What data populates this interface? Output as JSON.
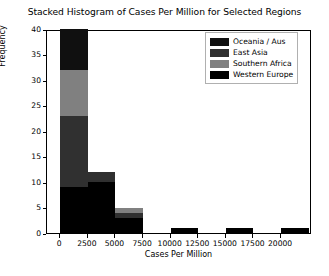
{
  "chart_data": {
    "type": "bar",
    "subtype": "stacked-histogram",
    "title": "Stacked Histogram of Cases Per Million for Selected Regions",
    "xlabel": "Cases Per Million",
    "ylabel": "Frequency",
    "xlim": [
      -1200,
      22800
    ],
    "ylim": [
      0,
      40
    ],
    "grid": false,
    "legend_position": "upper right",
    "bin_width": 2500,
    "bin_edges": [
      0,
      2500,
      5000,
      7500,
      10000,
      12500,
      15000,
      17500,
      20000,
      22500
    ],
    "xticks": [
      0,
      2500,
      5000,
      7500,
      10000,
      12500,
      15000,
      17500,
      20000
    ],
    "xtick_labels": [
      "0",
      "2500",
      "5000",
      "7500",
      "10000",
      "12500",
      "15000",
      "17500",
      "20000"
    ],
    "yticks": [
      0,
      5,
      10,
      15,
      20,
      25,
      30,
      35,
      40
    ],
    "ytick_labels": [
      "0",
      "5",
      "10",
      "15",
      "20",
      "25",
      "30",
      "35",
      "40"
    ],
    "categories": [
      "0-2500",
      "2500-5000",
      "5000-7500",
      "7500-10000",
      "10000-12500",
      "12500-15000",
      "15000-17500",
      "17500-20000",
      "20000-22500"
    ],
    "series": [
      {
        "name": "Western Europe",
        "color": "#000000",
        "values": [
          9,
          10,
          3,
          0,
          1,
          0,
          1,
          0,
          1
        ]
      },
      {
        "name": "Southern Africa",
        "color": "#808080",
        "values": [
          9,
          0,
          1,
          0,
          0,
          0,
          0,
          0,
          0
        ]
      },
      {
        "name": "East Asia",
        "color": "#303030",
        "values": [
          14,
          2,
          1,
          0,
          0,
          0,
          0,
          0,
          0
        ]
      },
      {
        "name": "Oceania / Aus",
        "color": "#101010",
        "values": [
          8,
          0,
          0,
          0,
          0,
          0,
          0,
          0,
          0
        ]
      }
    ],
    "stack_order": [
      "Western Europe",
      "East Asia",
      "Southern Africa",
      "Oceania / Aus"
    ],
    "totals": [
      40,
      12,
      5,
      0,
      1,
      0,
      1,
      0,
      1
    ]
  },
  "legend": {
    "entries": [
      {
        "label": "Oceania / Aus",
        "color": "#101010"
      },
      {
        "label": "East Asia",
        "color": "#303030"
      },
      {
        "label": "Southern Africa",
        "color": "#808080"
      },
      {
        "label": "Western Europe",
        "color": "#000000"
      }
    ]
  }
}
